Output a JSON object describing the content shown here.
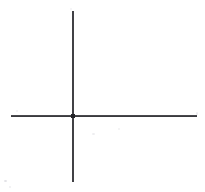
{
  "figure": {
    "kind": "line-drawing",
    "background_color": "#ffffff",
    "stroke_color": "#2e2e32",
    "canvas": {
      "width_px": 205,
      "height_px": 192
    },
    "intersection": {
      "label": "origin",
      "x_px": 73,
      "y_px": 116
    },
    "elements": [
      {
        "name": "vertical-axis",
        "orientation": "vertical",
        "x_px": 73,
        "start_y_px": 11,
        "end_y_px": 182,
        "length_px": 171,
        "thickness_px": 2,
        "color": "#2e2e32"
      },
      {
        "name": "horizontal-axis",
        "orientation": "horizontal",
        "y_px": 116,
        "start_x_px": 11,
        "end_x_px": 197,
        "length_px": 186,
        "thickness_px": 2,
        "color": "#2f2f33"
      }
    ],
    "annotations": [],
    "tick_labels": [],
    "axis_labels": []
  }
}
